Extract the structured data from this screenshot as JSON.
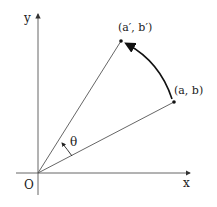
{
  "diagram": {
    "type": "rotation-of-point",
    "labels": {
      "y_axis": "y",
      "x_axis": "x",
      "origin": "O",
      "original_point": "(a, b)",
      "rotated_point": "(a′, b′)",
      "angle": "θ"
    },
    "points": {
      "origin": [
        38,
        173
      ],
      "original": [
        174,
        102
      ],
      "rotated": [
        121,
        41
      ]
    },
    "colors": {
      "stroke": "#444444",
      "arc": "#111111",
      "text": "#222222"
    }
  }
}
